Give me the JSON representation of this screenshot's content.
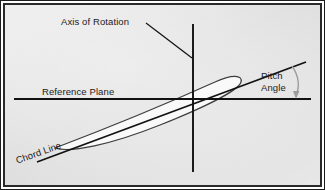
{
  "figure": {
    "background_color": "#e6e6e6",
    "frame_color": "#1c1c1c",
    "line_color": "#111111",
    "airfoil_fill": "#f7f7f7",
    "airfoil_stroke": "#3a3a3a",
    "arrow_color": "#9a9a9a"
  },
  "labels": {
    "axis_of_rotation": "Axis of Rotation",
    "reference_plane": "Reference Plane",
    "pitch_angle_line1": "Pitch",
    "pitch_angle_line2": "Angle",
    "chord_line": "Chord Line"
  },
  "geometry": {
    "axis_of_rotation_x": 193,
    "reference_plane_y": 99,
    "chord_line_angle_deg": 19.5,
    "airfoil_leading_edge": [
      55,
      148
    ],
    "airfoil_trailing_edge": [
      241,
      82
    ]
  }
}
